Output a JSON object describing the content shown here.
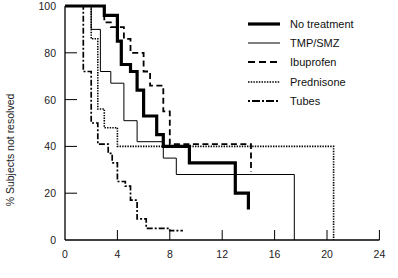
{
  "chart_data": {
    "type": "line",
    "subtype": "kaplan-meier step",
    "title": "",
    "xlabel": "",
    "ylabel": "% Subjects not resolved",
    "xlim": [
      0,
      24
    ],
    "ylim": [
      0,
      100
    ],
    "xticks": [
      0,
      4,
      8,
      12,
      16,
      20,
      24
    ],
    "yticks": [
      0,
      20,
      40,
      60,
      80,
      100
    ],
    "grid": false,
    "legend_position": "upper right",
    "series": [
      {
        "name": "No treatment",
        "style": "thick-solid",
        "x": [
          0,
          3.0,
          3.0,
          4.0,
          4.0,
          4.3,
          4.3,
          5.0,
          5.0,
          5.5,
          5.5,
          6.0,
          6.0,
          7.0,
          7.0,
          7.5,
          7.5,
          9.5,
          9.5,
          13.0,
          13.0,
          14.0,
          14.0
        ],
        "y": [
          100,
          100,
          96,
          96,
          85,
          85,
          75,
          75,
          72,
          72,
          64,
          64,
          53,
          53,
          45,
          45,
          40,
          40,
          33,
          33,
          20,
          20,
          13
        ]
      },
      {
        "name": "TMP/SMZ",
        "style": "thin-solid",
        "x": [
          0,
          2.0,
          2.0,
          2.7,
          2.7,
          3.5,
          3.5,
          4.5,
          4.5,
          5.5,
          5.5,
          7.5,
          7.5,
          8.5,
          8.5,
          17.5,
          17.5
        ],
        "y": [
          100,
          100,
          90,
          90,
          72,
          72,
          67,
          67,
          51,
          51,
          42,
          42,
          35,
          35,
          28,
          28,
          0
        ]
      },
      {
        "name": "Ibuprofen",
        "style": "dashed",
        "x": [
          0,
          3.0,
          3.0,
          3.5,
          3.5,
          4.5,
          4.5,
          5.0,
          5.0,
          6.0,
          6.0,
          6.5,
          6.5,
          7.5,
          7.5,
          8.0,
          8.0,
          14.2,
          14.2
        ],
        "y": [
          100,
          100,
          93,
          93,
          91,
          91,
          86,
          86,
          80,
          80,
          72,
          72,
          66,
          66,
          55,
          55,
          41,
          41,
          29
        ]
      },
      {
        "name": "Prednisone",
        "style": "dotted",
        "x": [
          0,
          2.0,
          2.0,
          2.5,
          2.5,
          3.0,
          3.0,
          4.0,
          4.0,
          20.5,
          20.5
        ],
        "y": [
          100,
          100,
          86,
          86,
          56,
          56,
          48,
          48,
          40,
          40,
          0
        ]
      },
      {
        "name": "Tubes",
        "style": "dash-dot",
        "x": [
          0,
          1.4,
          1.4,
          2.0,
          2.0,
          2.5,
          2.5,
          3.3,
          3.3,
          3.6,
          3.6,
          4.0,
          4.0,
          4.6,
          4.6,
          5.0,
          5.0,
          5.5,
          5.5,
          6.2,
          6.2,
          8.0,
          8.0,
          9.0
        ],
        "y": [
          100,
          100,
          72,
          72,
          50,
          50,
          41,
          41,
          37,
          37,
          33,
          33,
          25,
          25,
          23,
          23,
          17,
          17,
          9,
          9,
          5,
          5,
          4,
          4
        ]
      }
    ]
  },
  "legend": {
    "items": [
      {
        "label": "No treatment",
        "style": "thick-solid"
      },
      {
        "label": "TMP/SMZ",
        "style": "thin-solid"
      },
      {
        "label": "Ibuprofen",
        "style": "dashed"
      },
      {
        "label": "Prednisone",
        "style": "dotted"
      },
      {
        "label": "Tubes",
        "style": "dash-dot"
      }
    ]
  },
  "axes": {
    "ylabel": "% Subjects not resolved"
  }
}
